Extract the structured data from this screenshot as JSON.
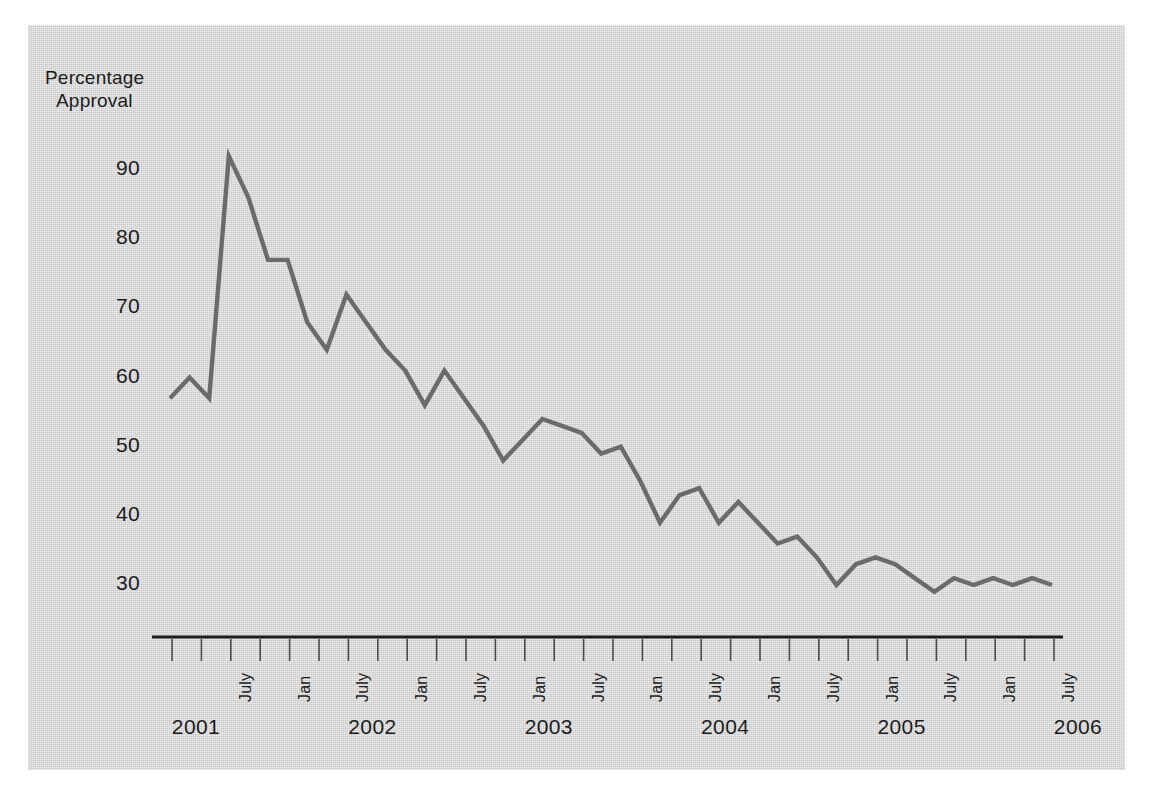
{
  "figure": {
    "background_color": "#ffffff",
    "panel_color": "#d4d4d4",
    "line_color": "#6b6b6b",
    "axis_color": "#1b1b1b",
    "text_color": "#1b1b1b"
  },
  "chart_data": {
    "type": "line",
    "title": "",
    "subtitle": "",
    "ylabel": "Percentage\nApproval",
    "ylabel_line1": "Percentage",
    "ylabel_line2": "Approval",
    "xlabel": "",
    "ylim": [
      25,
      95
    ],
    "yticks": [
      90,
      80,
      70,
      60,
      50,
      40,
      30
    ],
    "ytick_labels": [
      "90",
      "80",
      "70",
      "60",
      "50",
      "40",
      "30"
    ],
    "grid": false,
    "legend": "none",
    "x_minor_labels": [
      "July",
      "Jan",
      "July",
      "Jan",
      "July",
      "Jan",
      "July",
      "Jan",
      "July",
      "Jan",
      "July",
      "Jan",
      "July",
      "Jan",
      "July"
    ],
    "x_year_labels": [
      "2001",
      "2002",
      "2003",
      "2004",
      "2005",
      "2006",
      "2007",
      "2008"
    ],
    "x": [
      "2001-03",
      "2001-05",
      "2001-07",
      "2001-09",
      "2001-11",
      "2002-01",
      "2002-03",
      "2002-05",
      "2002-07",
      "2002-09",
      "2002-11",
      "2003-01",
      "2003-03",
      "2003-05",
      "2003-07",
      "2003-09",
      "2003-11",
      "2004-01",
      "2004-03",
      "2004-05",
      "2004-07",
      "2004-09",
      "2004-11",
      "2005-01",
      "2005-03",
      "2005-05",
      "2005-07",
      "2005-09",
      "2005-11",
      "2006-01",
      "2006-03",
      "2006-05",
      "2006-07",
      "2006-09",
      "2006-11",
      "2007-01",
      "2007-03",
      "2007-05",
      "2007-07",
      "2007-09",
      "2007-11",
      "2008-01",
      "2008-03",
      "2008-05",
      "2008-07",
      "2008-09"
    ],
    "values": [
      57,
      60,
      57,
      92,
      86,
      77,
      77,
      68,
      64,
      72,
      68,
      64,
      61,
      56,
      61,
      57,
      53,
      48,
      51,
      54,
      53,
      52,
      49,
      50,
      45,
      39,
      43,
      44,
      39,
      42,
      39,
      36,
      37,
      34,
      30,
      33,
      34,
      33,
      31,
      29,
      31,
      30,
      31,
      30,
      31,
      30
    ],
    "series": [
      {
        "name": "Presidential approval",
        "values": [
          57,
          60,
          57,
          92,
          86,
          77,
          77,
          68,
          64,
          72,
          68,
          64,
          61,
          56,
          61,
          57,
          53,
          48,
          51,
          54,
          53,
          52,
          49,
          50,
          45,
          39,
          43,
          44,
          39,
          42,
          39,
          36,
          37,
          34,
          30,
          33,
          34,
          33,
          31,
          29,
          31,
          30,
          31,
          30,
          31,
          30
        ]
      }
    ],
    "x_axis_start_year": 2001,
    "x_axis_end_year": 2008
  }
}
